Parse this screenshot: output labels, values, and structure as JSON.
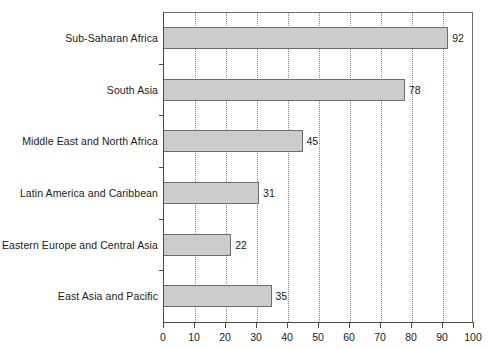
{
  "chart_data": {
    "type": "bar",
    "orientation": "horizontal",
    "title": "",
    "xlabel": "",
    "ylabel": "",
    "xlim": [
      0,
      100
    ],
    "xticks": [
      0,
      10,
      20,
      30,
      40,
      50,
      60,
      70,
      80,
      90,
      100
    ],
    "grid": "vertical-dotted",
    "legend": "none",
    "categories": [
      "Sub-Saharan Africa",
      "South Asia",
      "Middle East and North Africa",
      "Latin America and Caribbean",
      "Eastern Europe and Central Asia",
      "East Asia and Pacific"
    ],
    "values": [
      92,
      78,
      45,
      31,
      22,
      35
    ],
    "data_labels": [
      "92",
      "78",
      "45",
      "31",
      "22",
      "35"
    ],
    "bar_fill_color": "#cccccc",
    "bar_border_color": "#6d6d6d",
    "axis_color": "#4a4a4a",
    "grid_color": "#8a8a8a",
    "background_color": "#ffffff"
  }
}
